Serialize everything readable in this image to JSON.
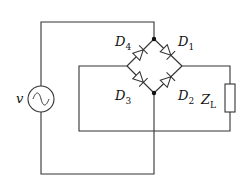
{
  "diagram": {
    "source": {
      "label": "v",
      "symbol": "ac-source"
    },
    "diodes": [
      {
        "id": "D1",
        "base": "D",
        "sub": "1",
        "from": "top-node",
        "to": "right-node"
      },
      {
        "id": "D2",
        "base": "D",
        "sub": "2",
        "from": "bottom-node",
        "to": "right-node"
      },
      {
        "id": "D3",
        "base": "D",
        "sub": "3",
        "from": "left-node",
        "to": "bottom-node"
      },
      {
        "id": "D4",
        "base": "D",
        "sub": "4",
        "from": "left-node",
        "to": "top-node"
      }
    ],
    "load": {
      "base": "Z",
      "sub": "L",
      "symbol": "resistor"
    },
    "colors": {
      "wire": "#333333",
      "background": "#ffffff"
    }
  }
}
